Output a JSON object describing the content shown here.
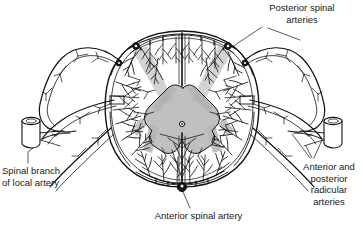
{
  "figure": {
    "type": "anatomical-line-diagram",
    "background_color": "#ffffff",
    "ink_color": "#111111",
    "gray_matter_color": "#b9b9b9",
    "gray_band_color": "#adadad",
    "text_color": "#1a1a1a"
  },
  "labels": {
    "posterior_spinal_arteries": "Posterior spinal\narteries",
    "spinal_branch_of_local_artery": "Spinal branch\nof local artery",
    "anterior_spinal_artery": "Anterior spinal artery",
    "anterior_and_posterior_radicular_arteries": "Anterior and\nposterior\nradicular\narteries"
  },
  "structures": {
    "cord_outline": "spinal cord cross-section oval",
    "gray_matter": "butterfly-shaped central gray matter",
    "central_canal": "small circle at center of gray matter",
    "anterior_median_fissure": "vertical cleft at bottom midline",
    "posterior_median_septum": "vertical cleft at top midline",
    "posterior_spinal_artery_left": "dark node, upper-left of cord",
    "posterior_spinal_artery_right": "dark node, upper-right of cord",
    "anterior_spinal_artery": "large dark node, bottom midline of cord",
    "radicular_artery_left": "node on left lateral cord surface",
    "radicular_artery_right": "node on right lateral cord surface",
    "local_artery_stub_left": "cut cylindrical vessel, far left",
    "local_artery_stub_right": "cut cylindrical vessel, far right",
    "vasocorona": "perimeter arterial ring with radiating penetrating branches"
  }
}
